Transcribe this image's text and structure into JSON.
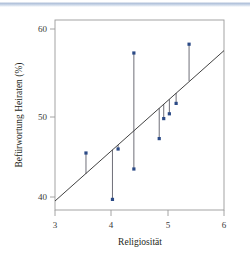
{
  "figure": {
    "background_color": "#ffffff",
    "top_band_color": "#aebfd9"
  },
  "chart_data": {
    "type": "scatter",
    "title": "",
    "subtitle": "",
    "xlabel": "Religiosität",
    "ylabel": "Befürwortung Heiraten (%)",
    "xlim": [
      2.78,
      6.2
    ],
    "ylim": [
      38.2,
      61.5
    ],
    "xticks": [
      3,
      4,
      5,
      6
    ],
    "xtick_labels": [
      "3",
      "4",
      "5",
      "6"
    ],
    "yticks": [
      40,
      50,
      60
    ],
    "ytick_labels": [
      "40",
      "50",
      "60"
    ],
    "grid": false,
    "legend": null,
    "point_color": "#2b4a86",
    "line_color": "#2b2b2b",
    "residual_color": "#4a4a55",
    "x": [
      3.55,
      4.02,
      4.12,
      4.4,
      4.4,
      4.85,
      4.93,
      5.03,
      5.15,
      5.38
    ],
    "y": [
      45.5,
      39.7,
      46.0,
      58.0,
      43.5,
      47.3,
      49.8,
      50.4,
      51.7,
      59.1
    ],
    "series": [
      {
        "name": "Beobachtungen",
        "points": [
          {
            "x": 3.55,
            "y": 45.5,
            "fitted": 42.9
          },
          {
            "x": 4.02,
            "y": 39.7,
            "fitted": 45.9
          },
          {
            "x": 4.12,
            "y": 46.0,
            "fitted": 46.5
          },
          {
            "x": 4.4,
            "y": 58.0,
            "fitted": 48.3
          },
          {
            "x": 4.4,
            "y": 43.5,
            "fitted": 48.3
          },
          {
            "x": 4.85,
            "y": 47.3,
            "fitted": 51.1
          },
          {
            "x": 4.93,
            "y": 49.8,
            "fitted": 51.6
          },
          {
            "x": 5.03,
            "y": 50.4,
            "fitted": 52.2
          },
          {
            "x": 5.15,
            "y": 51.7,
            "fitted": 53.0
          },
          {
            "x": 5.38,
            "y": 59.1,
            "fitted": 54.5
          }
        ]
      }
    ],
    "regression_line": {
      "name": "Regressionsgerade",
      "x_start": 3.0,
      "y_start": 39.5,
      "x_end": 6.0,
      "y_end": 58.3
    },
    "annotations": []
  }
}
